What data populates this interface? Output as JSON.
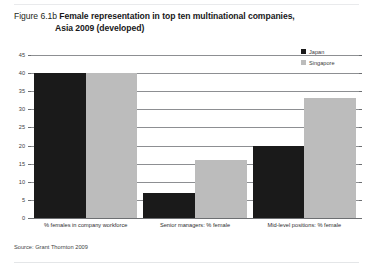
{
  "figure": {
    "number": "Figure 6.1b",
    "title_line1": "Female representation in top ten multinational companies,",
    "title_line2": "Asia 2009 (developed)",
    "source": "Source: Grant Thornton 2009"
  },
  "legend": {
    "position": "top-right",
    "items": [
      {
        "label": "Japan",
        "color": "#1a1a1a"
      },
      {
        "label": "Singapore",
        "color": "#bcbcbc"
      }
    ]
  },
  "axis": {
    "y_ticks": [
      "0",
      "5",
      "10",
      "15",
      "20",
      "25",
      "30",
      "35",
      "40",
      "45"
    ]
  },
  "chart_data": {
    "type": "bar",
    "title": "Female representation in top ten multinational companies, Asia 2009 (developed)",
    "categories": [
      "% females in company workforce",
      "Senior managers: % female",
      "Mid-level positions: % female"
    ],
    "series": [
      {
        "name": "Japan",
        "color": "#1a1a1a",
        "values": [
          40,
          7,
          20
        ]
      },
      {
        "name": "Singapore",
        "color": "#bcbcbc",
        "values": [
          40,
          16,
          33
        ]
      }
    ],
    "xlabel": "",
    "ylabel": "",
    "ylim": [
      0,
      45
    ],
    "ytick_step": 5,
    "grid": true,
    "legend_position": "top-right"
  }
}
